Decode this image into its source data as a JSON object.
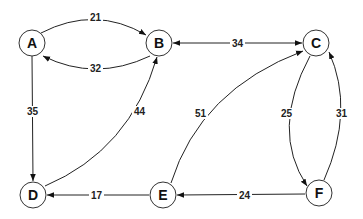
{
  "diagram": {
    "type": "directed-weighted-graph",
    "nodes": [
      {
        "id": "A",
        "label": "A",
        "x": 32,
        "y": 43
      },
      {
        "id": "B",
        "label": "B",
        "x": 159,
        "y": 43
      },
      {
        "id": "C",
        "label": "C",
        "x": 316,
        "y": 43
      },
      {
        "id": "D",
        "label": "D",
        "x": 33,
        "y": 195
      },
      {
        "id": "E",
        "label": "E",
        "x": 163,
        "y": 195
      },
      {
        "id": "F",
        "label": "F",
        "x": 319,
        "y": 193
      }
    ],
    "edges": [
      {
        "from": "A",
        "to": "B",
        "weight": "21",
        "directed": true
      },
      {
        "from": "B",
        "to": "A",
        "weight": "32",
        "directed": true
      },
      {
        "from": "B",
        "to": "C",
        "weight": "34",
        "directed": true,
        "bidirectional": true
      },
      {
        "from": "A",
        "to": "D",
        "weight": "35",
        "directed": true
      },
      {
        "from": "D",
        "to": "B",
        "weight": "44",
        "directed": true
      },
      {
        "from": "E",
        "to": "C",
        "weight": "51",
        "directed": true
      },
      {
        "from": "C",
        "to": "F",
        "weight": "25",
        "directed": true
      },
      {
        "from": "F",
        "to": "C",
        "weight": "31",
        "directed": true
      },
      {
        "from": "E",
        "to": "D",
        "weight": "17",
        "directed": true
      },
      {
        "from": "F",
        "to": "E",
        "weight": "24",
        "directed": true
      }
    ]
  },
  "labels": {
    "A": "A",
    "B": "B",
    "C": "C",
    "D": "D",
    "E": "E",
    "F": "F",
    "w_AB": "21",
    "w_BA": "32",
    "w_BC": "34",
    "w_AD": "35",
    "w_DB": "44",
    "w_EC": "51",
    "w_CF": "25",
    "w_FC": "31",
    "w_ED": "17",
    "w_FE": "24"
  }
}
